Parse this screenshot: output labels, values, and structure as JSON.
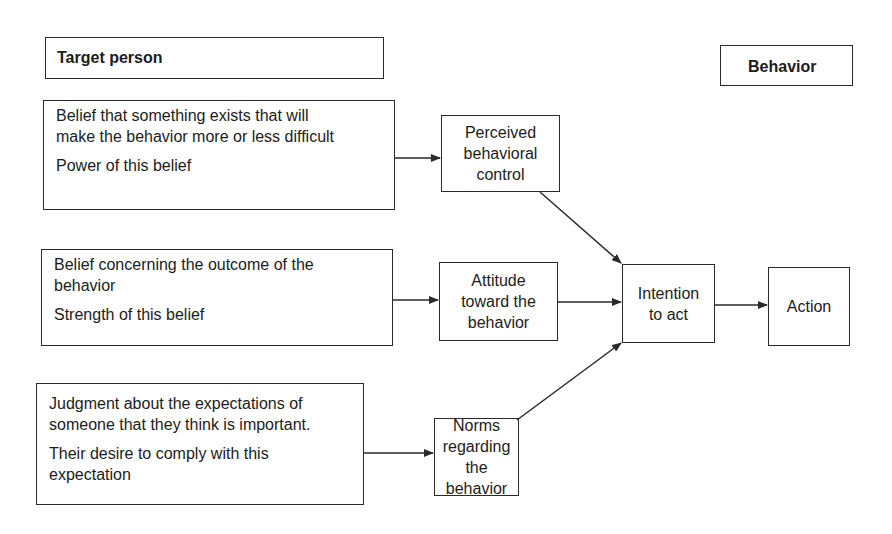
{
  "headers": {
    "target_person": "Target person",
    "behavior": "Behavior"
  },
  "beliefs": [
    {
      "line1": "Belief that something exists that will",
      "line2": "make the behavior more or less difficult",
      "weight": "Power of this belief"
    },
    {
      "line1": "Belief concerning the outcome of the",
      "line2": "behavior",
      "weight": "Strength of this belief"
    },
    {
      "line1": "Judgment about the expectations of",
      "line2": "someone that they think is important.",
      "weight_line1": "Their desire to comply with this",
      "weight_line2": "expectation"
    }
  ],
  "constructs": {
    "pbc": [
      "Perceived",
      "behavioral",
      "control"
    ],
    "attitude": [
      "Attitude",
      "toward the",
      "behavior"
    ],
    "norms": [
      "Norms",
      "regarding the",
      "behavior"
    ]
  },
  "intention": [
    "Intention",
    "to act"
  ],
  "action": "Action",
  "colors": {
    "line": "#2a2a2a",
    "text": "#1c1c1c",
    "background": "#ffffff"
  }
}
